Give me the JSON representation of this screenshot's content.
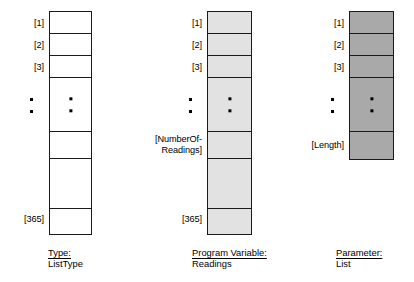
{
  "diagram": {
    "columns": [
      {
        "id": "type-column",
        "fill_color": "#ffffff",
        "border_color": "#1a1a1a",
        "index_labels": [
          "[1]",
          "[2]",
          "[3]",
          "[365]"
        ],
        "side_ellipsis_dots": 2,
        "cell_ellipsis_dots": 2,
        "caption_title": "Type:",
        "caption_value": "ListType"
      },
      {
        "id": "program-variable-column",
        "fill_color": "#e2e2e2",
        "border_color": "#1a1a1a",
        "index_labels": [
          "[1]",
          "[2]",
          "[3]",
          "[NumberOf-\nReadings]",
          "[365]"
        ],
        "side_ellipsis_dots": 2,
        "cell_ellipsis_dots": 2,
        "caption_title": "Program Variable:",
        "caption_value": "Readings"
      },
      {
        "id": "parameter-column",
        "fill_color": "#a9a9a9",
        "border_color": "#1a1a1a",
        "index_labels": [
          "[1]",
          "[2]",
          "[3]",
          "[Length]"
        ],
        "side_ellipsis_dots": 2,
        "cell_ellipsis_dots": 2,
        "caption_title": "Parameter:",
        "caption_value": "List"
      }
    ]
  }
}
